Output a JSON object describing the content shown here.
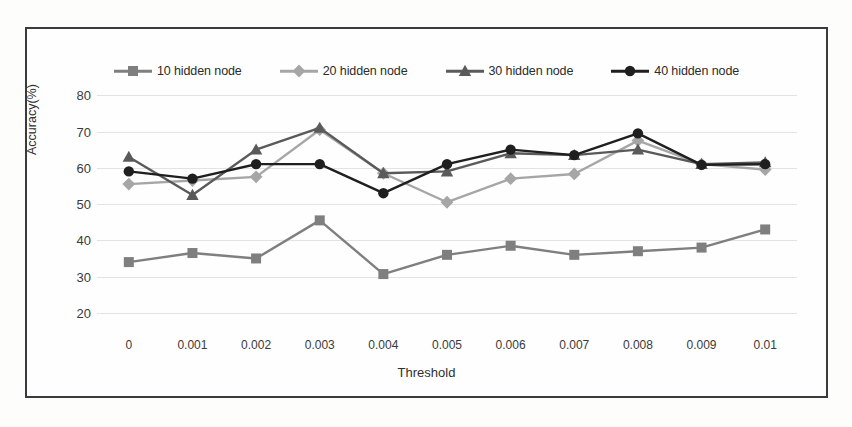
{
  "chart_data": {
    "type": "line",
    "title": "",
    "xlabel": "Threshold",
    "ylabel": "Accuracy(%)",
    "categories": [
      "0",
      "0.001",
      "0.002",
      "0.003",
      "0.004",
      "0.005",
      "0.006",
      "0.007",
      "0.008",
      "0.009",
      "0.01"
    ],
    "yticks": [
      20,
      30,
      40,
      50,
      60,
      70,
      80
    ],
    "ylim": [
      15,
      82
    ],
    "grid": true,
    "legend_position": "top-center",
    "series": [
      {
        "name": "10 hidden node",
        "color": "#7f7f7f",
        "marker": "square",
        "values": [
          34.0,
          36.5,
          35.0,
          45.5,
          30.7,
          36.0,
          38.5,
          36.0,
          37.0,
          38.0,
          43.0
        ]
      },
      {
        "name": "20 hidden node",
        "color": "#a6a6a6",
        "marker": "diamond",
        "values": [
          55.5,
          56.5,
          57.5,
          70.5,
          58.5,
          50.5,
          57.0,
          58.3,
          67.5,
          61.0,
          59.5
        ]
      },
      {
        "name": "30 hidden node",
        "color": "#5a5a5a",
        "marker": "triangle",
        "values": [
          63.0,
          52.5,
          65.0,
          71.0,
          58.5,
          59.0,
          64.0,
          63.5,
          65.0,
          61.0,
          61.5
        ]
      },
      {
        "name": "40 hidden node",
        "color": "#1f1f1f",
        "marker": "circle",
        "values": [
          59.0,
          57.0,
          61.0,
          61.0,
          53.0,
          61.0,
          65.0,
          63.5,
          69.5,
          60.8,
          61.0
        ]
      }
    ]
  }
}
